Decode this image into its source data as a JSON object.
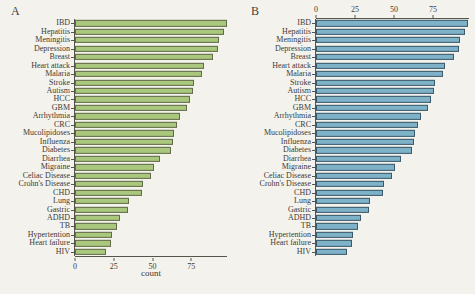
{
  "figure": {
    "panels": [
      {
        "letter": "A"
      },
      {
        "letter": "B"
      }
    ]
  },
  "chart_data": [
    {
      "type": "bar",
      "orientation": "horizontal",
      "panel": "A",
      "title": "",
      "xlabel": "count",
      "ylabel": "",
      "xlim": [
        0,
        98
      ],
      "xticks": [
        0,
        25,
        50,
        75
      ],
      "axis_position": "bottom",
      "grid": false,
      "bar_color": "#aac87d",
      "bar_border": "#636a4a",
      "categories": [
        "IBD",
        "Hepatitis",
        "Meningitis",
        "Depression",
        "Breast",
        "Heart attack",
        "Malaria",
        "Stroke",
        "Autism",
        "HCC",
        "GBM",
        "Arrhythmia",
        "CRC",
        "Mucolipidoses",
        "Influenza",
        "Diabetes",
        "Diarrhea",
        "Migraine",
        "Celiac Disease",
        "Crohn's Disease",
        "CHD",
        "Lung",
        "Gastric",
        "ADHD",
        "TB",
        "Hypertention",
        "Heart failure",
        "HIV"
      ],
      "values": [
        98,
        96,
        93,
        92,
        89,
        83,
        82,
        77,
        76,
        74,
        72,
        68,
        66,
        64,
        63,
        62,
        55,
        51,
        49,
        44,
        43,
        35,
        34,
        29,
        27,
        24,
        23,
        20
      ]
    },
    {
      "type": "bar",
      "orientation": "horizontal",
      "panel": "B",
      "title": "",
      "xlabel": "",
      "ylabel": "",
      "xlim": [
        0,
        98
      ],
      "xticks": [
        0,
        25,
        50,
        75
      ],
      "axis_position": "top",
      "grid": false,
      "bar_color": "#7eb2c9",
      "bar_border": "#3d5868",
      "categories": [
        "IBD",
        "Hepatitis",
        "Meningitis",
        "Depression",
        "Breast",
        "Heart attack",
        "Malaria",
        "Stroke",
        "Autism",
        "HCC",
        "GBM",
        "Arrhythmia",
        "CRC",
        "Mucolipidoses",
        "Influenza",
        "Diabetes",
        "Diarrhea",
        "Migraine",
        "Celiac Disease",
        "Crohn's Disease",
        "CHD",
        "Lung",
        "Gastric",
        "ADHD",
        "TB",
        "Hypertention",
        "Heart failure",
        "HIV"
      ],
      "values": [
        98,
        96,
        93,
        92,
        89,
        83,
        82,
        77,
        76,
        74,
        72,
        68,
        66,
        64,
        63,
        62,
        55,
        51,
        49,
        44,
        43,
        35,
        34,
        29,
        27,
        24,
        23,
        20
      ]
    }
  ]
}
